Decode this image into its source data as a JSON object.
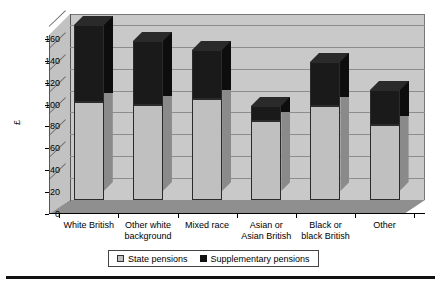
{
  "chart_data": {
    "type": "bar",
    "subtype": "stacked-3d-column",
    "title": "",
    "xlabel": "",
    "ylabel": "£",
    "ylim": [
      0,
      170
    ],
    "yticks": [
      0,
      20,
      40,
      60,
      80,
      100,
      120,
      140,
      160
    ],
    "grid": true,
    "legend_position": "bottom",
    "categories": [
      "White British",
      "Other white background",
      "Mixed race",
      "Asian or Asian British",
      "Black or black British",
      "Other"
    ],
    "category_lines": [
      [
        "White British"
      ],
      [
        "Other white",
        "background"
      ],
      [
        "Mixed race"
      ],
      [
        "Asian or",
        "Asian British"
      ],
      [
        "Black or",
        "black British"
      ],
      [
        "Other"
      ]
    ],
    "series": [
      {
        "name": "State pensions",
        "color": "#c0c0c0",
        "values": [
          90,
          87,
          92,
          72,
          86,
          69
        ]
      },
      {
        "name": "Supplementary pensions",
        "color": "#1a1a1a",
        "values": [
          70,
          58,
          45,
          14,
          40,
          32
        ]
      }
    ],
    "totals": [
      160,
      145,
      137,
      86,
      126,
      101
    ]
  },
  "axis": {
    "y_label": "£",
    "y_tick_labels": [
      "0",
      "20",
      "40",
      "60",
      "80",
      "100",
      "120",
      "140",
      "160"
    ]
  },
  "legend": {
    "items": [
      {
        "label": "State pensions",
        "swatch": "gray-square-icon"
      },
      {
        "label": "Supplementary pensions",
        "swatch": "black-square-icon"
      }
    ]
  },
  "colors": {
    "state_pensions": "#c0c0c0",
    "supplementary_pensions": "#1a1a1a",
    "plot_background": "#c9c9c9",
    "floor": "#8f8f8f",
    "gridline": "#8d8d8d",
    "page_background": "#ffffff"
  }
}
